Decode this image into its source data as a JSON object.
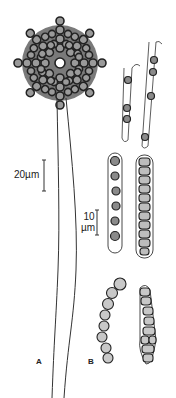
{
  "figure": {
    "panels": [
      {
        "id": "A",
        "label": "A",
        "description": "conidiophore with radiating conidial head"
      },
      {
        "id": "B",
        "label": "B",
        "description": "asci and spore chains"
      }
    ],
    "scale_bars": [
      {
        "label": "20µm"
      },
      {
        "label_line1": "10",
        "label_line2": "µm"
      }
    ],
    "colors": {
      "ink": "#222222",
      "cell_fill": "#9a9a9a",
      "background": "#ffffff"
    }
  }
}
